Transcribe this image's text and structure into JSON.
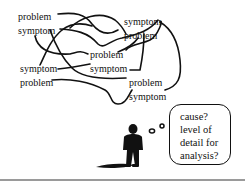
{
  "diagram": {
    "tangle_labels": [
      {
        "id": "pair-top-left",
        "lines": [
          "problem",
          "symptom"
        ],
        "x": 18,
        "y": 12
      },
      {
        "id": "pair-top-right",
        "lines": [
          "symptom",
          "problem"
        ],
        "x": 124,
        "y": 17
      },
      {
        "id": "pair-center",
        "lines": [
          "problem",
          "symptom"
        ],
        "x": 90,
        "y": 50
      },
      {
        "id": "pair-left",
        "lines": [
          "symptom",
          "problem"
        ],
        "x": 20,
        "y": 64
      },
      {
        "id": "pair-bottom-right",
        "lines": [
          "problem",
          "symptom"
        ],
        "x": 129,
        "y": 78
      }
    ],
    "thought_bubble": {
      "lines": [
        "cause?",
        "level of",
        "detail for",
        "analysis?"
      ]
    },
    "figure": "thinking-person-silhouette",
    "colors": {
      "ink": "#111111",
      "background": "#ffffff",
      "divider": "#9a9a9a"
    }
  }
}
